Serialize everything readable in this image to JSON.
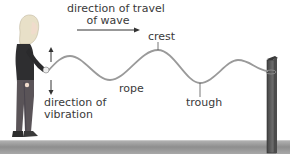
{
  "diagram": {
    "labels": {
      "travel_line1": "direction of travel",
      "travel_line2": "of wave",
      "crest": "crest",
      "rope": "rope",
      "trough": "trough",
      "vibration_line1": "direction of",
      "vibration_line2": "vibration"
    },
    "colors": {
      "rope": "#9a9a9a",
      "text": "#3a3a3a",
      "arrow": "#333333",
      "ground": "#8f8f8f",
      "post": "#5a5a5a"
    },
    "icons": {
      "travel_arrow": "right-arrow",
      "vibration_up_arrow": "up-arrow",
      "vibration_down_arrow": "down-arrow",
      "person": "person-holding-rope",
      "post": "wooden-post"
    }
  }
}
